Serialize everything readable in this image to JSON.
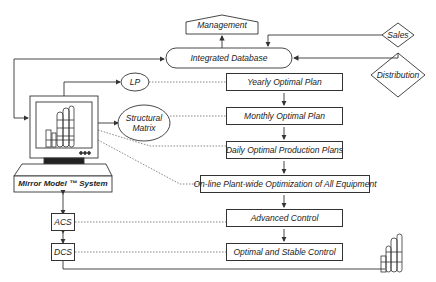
{
  "diagram": {
    "top": {
      "management": "Management",
      "integrated_database": "Integrated Database",
      "sales": "Sales",
      "distribution": "Distribution"
    },
    "left": {
      "lp": "LP",
      "structural_matrix_line1": "Structural",
      "structural_matrix_line2": "Matrix",
      "mirror_model": "Mirror Model ™ System",
      "acs": "ACS",
      "dcs": "DCS"
    },
    "hierarchy": [
      {
        "label": "Yearly Optimal Plan"
      },
      {
        "label": "Monthly Optimal Plan"
      },
      {
        "label": "Daily Optimal Production Plans"
      },
      {
        "label": "On-line Plant-wide Optimization of All Equipment"
      },
      {
        "label": "Advanced Control"
      },
      {
        "label": "Optimal and Stable Control"
      }
    ],
    "colors": {
      "line": "#333333",
      "background": "#ffffff"
    }
  }
}
